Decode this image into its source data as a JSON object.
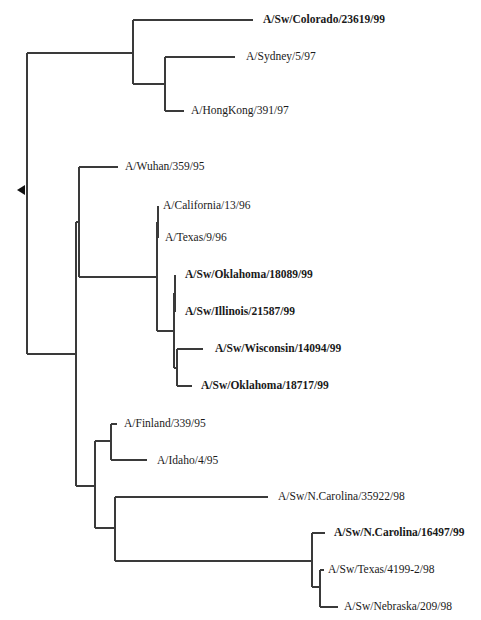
{
  "figure": {
    "type": "phylogenetic-tree",
    "root_marker": {
      "icon": "left-arrow-icon",
      "x": 17,
      "y": 190
    },
    "leaves": [
      {
        "id": "colorado",
        "label": "A/Sw/Colorado/23619/99",
        "bold": true,
        "x": 263,
        "y": 20
      },
      {
        "id": "sydney",
        "label": "A/Sydney/5/97",
        "bold": false,
        "x": 246,
        "y": 57
      },
      {
        "id": "hongkong",
        "label": "A/HongKong/391/97",
        "bold": false,
        "x": 191,
        "y": 111
      },
      {
        "id": "wuhan",
        "label": "A/Wuhan/359/95",
        "bold": false,
        "x": 125,
        "y": 167
      },
      {
        "id": "california",
        "label": "A/California/13/96",
        "bold": false,
        "x": 163,
        "y": 206
      },
      {
        "id": "texas96",
        "label": "A/Texas/9/96",
        "bold": false,
        "x": 165,
        "y": 238
      },
      {
        "id": "oklahoma1",
        "label": "A/Sw/Oklahoma/18089/99",
        "bold": true,
        "x": 185,
        "y": 275
      },
      {
        "id": "illinois",
        "label": "A/Sw/Illinois/21587/99",
        "bold": true,
        "x": 185,
        "y": 312
      },
      {
        "id": "wisconsin",
        "label": "A/Sw/Wisconsin/14094/99",
        "bold": true,
        "x": 215,
        "y": 349
      },
      {
        "id": "oklahoma2",
        "label": "A/Sw/Oklahoma/18717/99",
        "bold": true,
        "x": 201,
        "y": 386
      },
      {
        "id": "finland",
        "label": "A/Finland/339/95",
        "bold": false,
        "x": 124,
        "y": 424
      },
      {
        "id": "idaho",
        "label": "A/Idaho/4/95",
        "bold": false,
        "x": 157,
        "y": 461
      },
      {
        "id": "ncarolina1",
        "label": "A/Sw/N.Carolina/35922/98",
        "bold": false,
        "x": 278,
        "y": 497
      },
      {
        "id": "ncarolina2",
        "label": "A/Sw/N.Carolina/16497/99",
        "bold": true,
        "x": 334,
        "y": 533
      },
      {
        "id": "texas98",
        "label": "A/Sw/Texas/4199-2/98",
        "bold": false,
        "x": 328,
        "y": 570
      },
      {
        "id": "nebraska",
        "label": "A/Sw/Nebraska/209/98",
        "bold": false,
        "x": 344,
        "y": 607
      }
    ],
    "branches": [
      [
        27,
        53,
        27,
        354
      ],
      [
        27,
        53,
        133,
        53
      ],
      [
        133,
        20,
        133,
        84
      ],
      [
        133,
        20,
        253,
        20
      ],
      [
        133,
        84,
        165,
        84
      ],
      [
        165,
        57,
        165,
        111
      ],
      [
        165,
        57,
        235,
        57
      ],
      [
        165,
        111,
        184,
        111
      ],
      [
        27,
        354,
        76,
        354
      ],
      [
        76,
        222,
        76,
        486
      ],
      [
        76,
        222,
        79,
        222
      ],
      [
        79,
        167,
        79,
        277
      ],
      [
        79,
        167,
        118,
        167
      ],
      [
        79,
        277,
        157,
        277
      ],
      [
        157,
        222,
        157,
        331
      ],
      [
        157,
        222,
        158,
        222
      ],
      [
        158,
        206,
        158,
        238
      ],
      [
        158,
        206,
        158,
        206
      ],
      [
        158,
        238,
        158,
        238
      ],
      [
        157,
        331,
        174,
        331
      ],
      [
        174,
        293,
        174,
        368
      ],
      [
        174,
        293,
        175,
        293
      ],
      [
        175,
        275,
        175,
        312
      ],
      [
        174,
        368,
        177,
        368
      ],
      [
        177,
        349,
        177,
        386
      ],
      [
        177,
        349,
        203,
        349
      ],
      [
        177,
        386,
        192,
        386
      ],
      [
        76,
        486,
        95,
        486
      ],
      [
        95,
        441,
        95,
        528
      ],
      [
        95,
        441,
        111,
        441
      ],
      [
        111,
        424,
        111,
        460
      ],
      [
        111,
        424,
        117,
        424
      ],
      [
        111,
        460,
        147,
        460
      ],
      [
        95,
        528,
        115,
        528
      ],
      [
        115,
        497,
        115,
        561
      ],
      [
        115,
        497,
        268,
        497
      ],
      [
        115,
        561,
        312,
        561
      ],
      [
        312,
        533,
        312,
        587
      ],
      [
        312,
        533,
        325,
        533
      ],
      [
        312,
        587,
        320,
        587
      ],
      [
        320,
        570,
        320,
        607
      ],
      [
        320,
        570,
        324,
        570
      ],
      [
        320,
        607,
        338,
        607
      ]
    ]
  }
}
